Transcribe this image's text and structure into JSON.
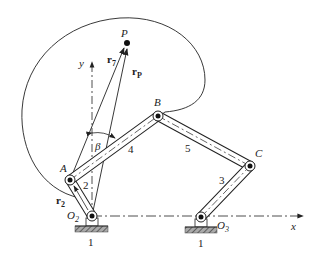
{
  "diagram": {
    "type": "six-bar linkage with coupler point",
    "labels": {
      "P": "P",
      "r7": "r",
      "r7_sub": "7",
      "rP": "r",
      "rP_sub": "P",
      "y": "y",
      "x": "x",
      "B": "B",
      "A": "A",
      "C": "C",
      "beta": "β",
      "link4": "4",
      "link5": "5",
      "link3": "3",
      "link2": "2",
      "r2": "r",
      "r2_sub": "2",
      "O2": "O",
      "O2_sub": "2",
      "O3": "O",
      "O3_sub": "3",
      "ground1": "1",
      "ground2": "1"
    },
    "points": {
      "O2": [
        92,
        216
      ],
      "A": [
        70,
        180
      ],
      "B": [
        158,
        116
      ],
      "C": [
        250,
        166
      ],
      "O3": [
        201,
        217
      ],
      "P": [
        127,
        43
      ]
    },
    "colors": {
      "line": "#222222",
      "hatch": "#555555"
    }
  }
}
